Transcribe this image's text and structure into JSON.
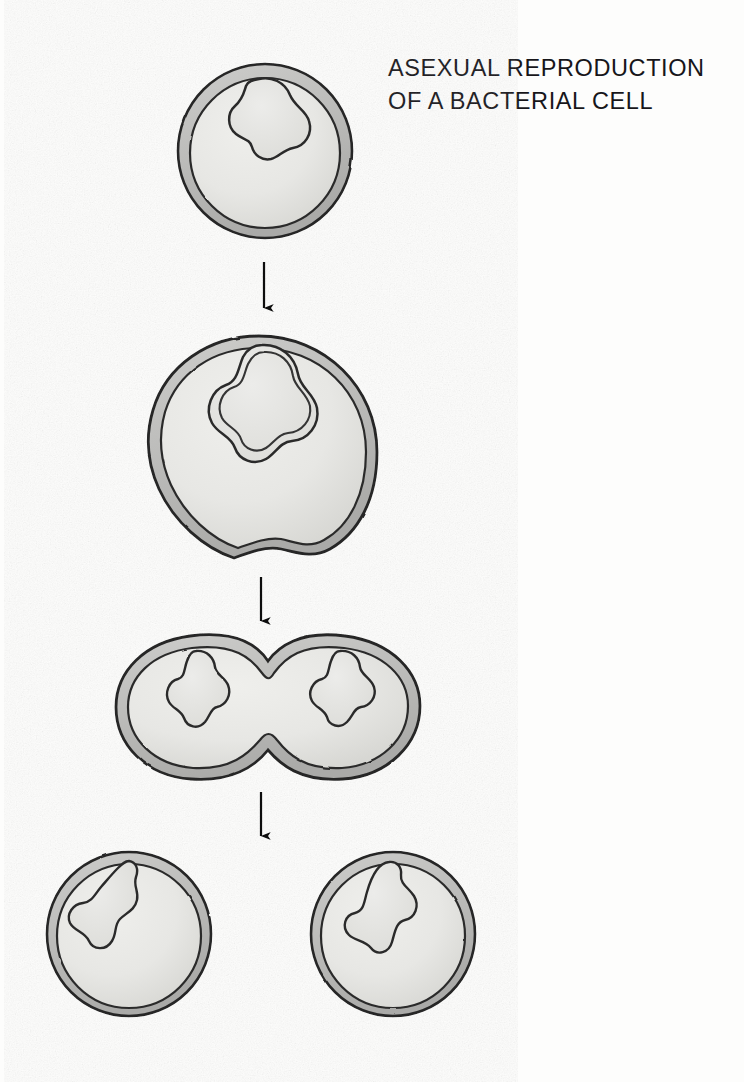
{
  "figure": {
    "title_line_1": "ASEXUAL REPRODUCTION",
    "title_line_2": "OF A BACTERIAL CELL",
    "title_text": "ASEXUAL REPRODUCTION\nOF A BACTERIAL CELL",
    "medium": "pencil-and-graphite scientific illustration",
    "background_color": "#fdfdfc"
  },
  "palette": {
    "outline": "#262626",
    "wall_band": "#c6c6c4",
    "wall_band_dark": "#a9a9a7",
    "cytoplasm": "#e7e7e4",
    "cytoplasm_shadow": "#d5d5d2",
    "nucleoid_fill": "#e2e2df",
    "nucleoid_outline": "#2b2b2b",
    "arrow": "#111111",
    "title_color": "#17161a"
  },
  "stages": [
    {
      "id": "stage-1",
      "label": "single bacterial cell",
      "order": 1,
      "description": "Round bacterial cell with a double-layered wall and one irregular nucleoid at the top centre.",
      "center": {
        "x": 265,
        "y": 151
      },
      "radius": 88,
      "nucleoid_count": 1,
      "shape": "circle"
    },
    {
      "id": "stage-2",
      "label": "cell grows and genetic material replicates",
      "order": 2,
      "description": "Enlarged cell; the nucleoid has duplicated, showing a doubled outline, and a shallow furrow begins at the bottom.",
      "center": {
        "x": 259,
        "y": 452
      },
      "radius": 118,
      "nucleoid_count": 2,
      "shape": "circle-with-furrow"
    },
    {
      "id": "stage-3",
      "label": "cell elongates and pinches in the middle",
      "order": 3,
      "description": "Dumbbell-shaped cell with a deep constriction at the waist and one nucleoid in each lobe.",
      "center": {
        "x": 267,
        "y": 705
      },
      "nucleoid_count": 2,
      "shape": "dumbbell"
    },
    {
      "id": "stage-4",
      "label": "two identical daughter cells",
      "order": 4,
      "description": "Two separate round daughter cells, each containing one nucleoid.",
      "nucleoid_count": 2,
      "shape": "two-circles",
      "cells": [
        {
          "id": "daughter-cell-left",
          "center": {
            "x": 129,
            "y": 934
          },
          "radius": 83
        },
        {
          "id": "daughter-cell-right",
          "center": {
            "x": 393,
            "y": 934
          },
          "radius": 83
        }
      ]
    }
  ],
  "arrows": [
    {
      "id": "arrow-1",
      "from_stage": "stage-1",
      "to_stage": "stage-2",
      "x": 264,
      "y_start": 262,
      "y_end": 318,
      "direction": "down"
    },
    {
      "id": "arrow-2",
      "from_stage": "stage-2",
      "to_stage": "stage-3",
      "x": 261,
      "y_start": 577,
      "y_end": 631,
      "direction": "down"
    },
    {
      "id": "arrow-3",
      "from_stage": "stage-3",
      "to_stage": "stage-4",
      "x": 261,
      "y_start": 792,
      "y_end": 846,
      "direction": "down"
    }
  ]
}
